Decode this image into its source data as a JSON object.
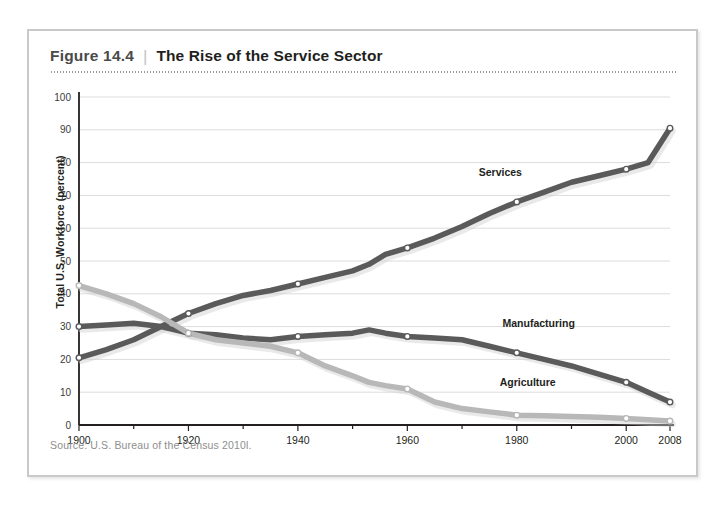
{
  "figure": {
    "number": "Figure 14.4",
    "separator": "|",
    "title": "The Rise of the Service Sector",
    "source": "Source:  U.S. Bureau of the Census 2010l."
  },
  "colors": {
    "dark_line": "#5a5a5a",
    "light_line": "#b8b8b8",
    "gridline": "#dcdcdc",
    "axis": "#231f20",
    "frame_border": "#c9c9c9",
    "marker_fill": "#ffffff"
  },
  "chart_data": {
    "type": "line",
    "title": "The Rise of the Service Sector",
    "xlabel": "",
    "ylabel": "Total U.S. Workforce (percent)",
    "xlim": [
      1900,
      2008
    ],
    "ylim": [
      0,
      100
    ],
    "ytick_labels": [
      "0",
      "10",
      "20",
      "30",
      "40",
      "50",
      "60",
      "70",
      "80",
      "90",
      "100"
    ],
    "yticks": [
      0,
      10,
      20,
      30,
      40,
      50,
      60,
      70,
      80,
      90,
      100
    ],
    "xtick_labels": [
      "1900",
      "1920",
      "1940",
      "1960",
      "1980",
      "2000",
      "2008"
    ],
    "xticks": [
      1900,
      1920,
      1940,
      1960,
      1980,
      2000,
      2008
    ],
    "grid": true,
    "legend_position": "inline-labels",
    "marked_years": [
      1900,
      1920,
      1940,
      1960,
      1980,
      2000,
      2008
    ],
    "series": [
      {
        "name": "Services",
        "color": "#5a5a5a",
        "label_x": 1977,
        "label_y": 76,
        "x": [
          1900,
          1905,
          1910,
          1915,
          1920,
          1925,
          1930,
          1935,
          1940,
          1945,
          1950,
          1953,
          1956,
          1960,
          1965,
          1970,
          1975,
          1980,
          1985,
          1990,
          1995,
          2000,
          2004,
          2008
        ],
        "values": [
          20.5,
          23,
          26,
          30,
          34,
          37,
          39.5,
          41,
          43,
          45,
          47,
          49,
          52,
          54,
          57,
          60.5,
          64.5,
          68,
          71,
          74,
          76,
          78,
          80,
          90.5
        ],
        "marked_values": [
          20.5,
          34,
          43,
          54,
          68,
          78,
          90.5
        ]
      },
      {
        "name": "Manufacturing",
        "color": "#5a5a5a",
        "label_x": 1984,
        "label_y": 30,
        "x": [
          1900,
          1905,
          1910,
          1915,
          1920,
          1925,
          1930,
          1935,
          1940,
          1945,
          1950,
          1953,
          1956,
          1960,
          1965,
          1970,
          1975,
          1980,
          1985,
          1990,
          1995,
          2000,
          2004,
          2008
        ],
        "values": [
          30,
          30.5,
          31,
          30,
          28,
          27.5,
          26.5,
          26,
          27,
          27.5,
          28,
          29,
          28,
          27,
          26.5,
          26,
          24,
          22,
          20,
          18,
          15.5,
          13,
          10,
          7
        ],
        "marked_values": [
          30,
          28,
          27,
          27,
          22,
          13,
          7
        ]
      },
      {
        "name": "Agriculture",
        "color": "#b8b8b8",
        "label_x": 1982,
        "label_y": 12,
        "x": [
          1900,
          1905,
          1910,
          1915,
          1920,
          1925,
          1930,
          1935,
          1940,
          1945,
          1950,
          1953,
          1956,
          1960,
          1965,
          1970,
          1975,
          1980,
          1985,
          1990,
          1995,
          2000,
          2004,
          2008
        ],
        "values": [
          42.5,
          40,
          37,
          33,
          28,
          26,
          25,
          24,
          22,
          18,
          15,
          13,
          12,
          11,
          7,
          5,
          4,
          3,
          2.8,
          2.6,
          2.4,
          2,
          1.6,
          1.2
        ],
        "marked_values": [
          42.5,
          28,
          22,
          11,
          3,
          2,
          1.2
        ]
      }
    ]
  }
}
